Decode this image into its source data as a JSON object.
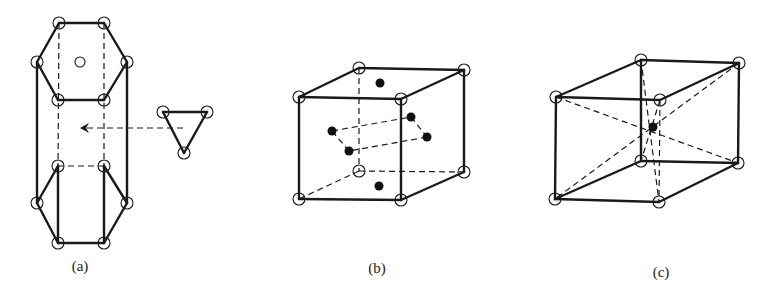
{
  "figure": {
    "panels": [
      {
        "id": "a",
        "label": "(a)",
        "label_pos": [
          80,
          258
        ],
        "description": "Hexagonal prism unit with triangular group moved in via arrow",
        "solid_lines": [
          [
            59,
            23,
            104,
            23
          ],
          [
            104,
            23,
            127,
            62
          ],
          [
            127,
            62,
            104,
            100
          ],
          [
            104,
            100,
            58,
            100
          ],
          [
            58,
            100,
            37,
            62
          ],
          [
            37,
            62,
            59,
            23
          ],
          [
            37,
            62,
            37,
            203
          ],
          [
            127,
            62,
            127,
            203
          ],
          [
            58,
            166,
            37,
            203
          ],
          [
            37,
            203,
            58,
            243
          ],
          [
            58,
            243,
            104,
            243
          ],
          [
            104,
            243,
            127,
            203
          ],
          [
            127,
            203,
            104,
            166
          ],
          [
            58,
            166,
            58,
            243
          ],
          [
            104,
            166,
            104,
            243
          ],
          [
            163,
            112,
            207,
            112
          ],
          [
            207,
            112,
            184,
            153
          ],
          [
            184,
            153,
            163,
            112
          ]
        ],
        "dashed_lines": [
          [
            59,
            23,
            58,
            166
          ],
          [
            104,
            23,
            104,
            166
          ],
          [
            58,
            166,
            104,
            166
          ],
          [
            183,
            128,
            86,
            128
          ]
        ],
        "arrow_head": [
          80,
          128
        ],
        "open_atoms": [
          [
            59,
            23
          ],
          [
            104,
            23
          ],
          [
            37,
            62
          ],
          [
            127,
            62
          ],
          [
            58,
            100
          ],
          [
            104,
            100
          ],
          [
            80,
            62
          ],
          [
            58,
            166
          ],
          [
            104,
            166
          ],
          [
            37,
            203
          ],
          [
            127,
            203
          ],
          [
            58,
            243
          ],
          [
            104,
            243
          ],
          [
            163,
            112
          ],
          [
            207,
            112
          ],
          [
            184,
            153
          ]
        ],
        "filled_atoms": []
      },
      {
        "id": "b",
        "label": "(b)",
        "label_pos": [
          377,
          260
        ],
        "description": "Cube with face-centered atoms (filled dots)",
        "solid_lines": [
          [
            299,
            97,
            401,
            99
          ],
          [
            401,
            99,
            401,
            200
          ],
          [
            401,
            200,
            299,
            199
          ],
          [
            299,
            199,
            299,
            97
          ],
          [
            299,
            97,
            359,
            68
          ],
          [
            359,
            68,
            464,
            70
          ],
          [
            464,
            70,
            401,
            99
          ],
          [
            464,
            70,
            464,
            172
          ],
          [
            464,
            172,
            401,
            200
          ]
        ],
        "dashed_lines": [
          [
            359,
            68,
            359,
            171
          ],
          [
            359,
            171,
            299,
            199
          ],
          [
            359,
            171,
            464,
            172
          ],
          [
            332,
            131,
            411,
            117
          ],
          [
            411,
            117,
            427,
            137
          ],
          [
            427,
            137,
            349,
            151
          ],
          [
            349,
            151,
            332,
            131
          ]
        ],
        "open_atoms": [
          [
            299,
            97
          ],
          [
            401,
            99
          ],
          [
            299,
            199
          ],
          [
            401,
            200
          ],
          [
            359,
            68
          ],
          [
            464,
            70
          ],
          [
            359,
            171
          ],
          [
            464,
            172
          ]
        ],
        "filled_atoms": [
          [
            380,
            83
          ],
          [
            332,
            131
          ],
          [
            411,
            117
          ],
          [
            427,
            137
          ],
          [
            349,
            151
          ],
          [
            379,
            186
          ]
        ]
      },
      {
        "id": "c",
        "label": "(c)",
        "label_pos": [
          661,
          264
        ],
        "description": "Body-centered rectangular cell with body diagonals",
        "solid_lines": [
          [
            556,
            97,
            641,
            60
          ],
          [
            641,
            60,
            739,
            63
          ],
          [
            739,
            63,
            660,
            100
          ],
          [
            660,
            100,
            556,
            97
          ],
          [
            556,
            97,
            555,
            199
          ],
          [
            641,
            60,
            641,
            161
          ],
          [
            739,
            63,
            738,
            163
          ],
          [
            555,
            199,
            659,
            202
          ],
          [
            659,
            202,
            738,
            163
          ],
          [
            738,
            163,
            641,
            161
          ],
          [
            641,
            161,
            555,
            199
          ]
        ],
        "dashed_lines": [
          [
            660,
            100,
            659,
            202
          ],
          [
            556,
            97,
            738,
            163
          ],
          [
            739,
            63,
            555,
            199
          ],
          [
            641,
            60,
            659,
            202
          ],
          [
            660,
            100,
            641,
            161
          ]
        ],
        "open_atoms": [
          [
            556,
            97
          ],
          [
            641,
            60
          ],
          [
            739,
            63
          ],
          [
            660,
            100
          ],
          [
            555,
            199
          ],
          [
            641,
            161
          ],
          [
            738,
            163
          ],
          [
            659,
            202
          ]
        ],
        "filled_atoms": [
          [
            653,
            127
          ]
        ]
      }
    ],
    "atom_radius_open": 6,
    "atom_radius_filled": 4.5,
    "atom_radius_center_open": 5
  }
}
